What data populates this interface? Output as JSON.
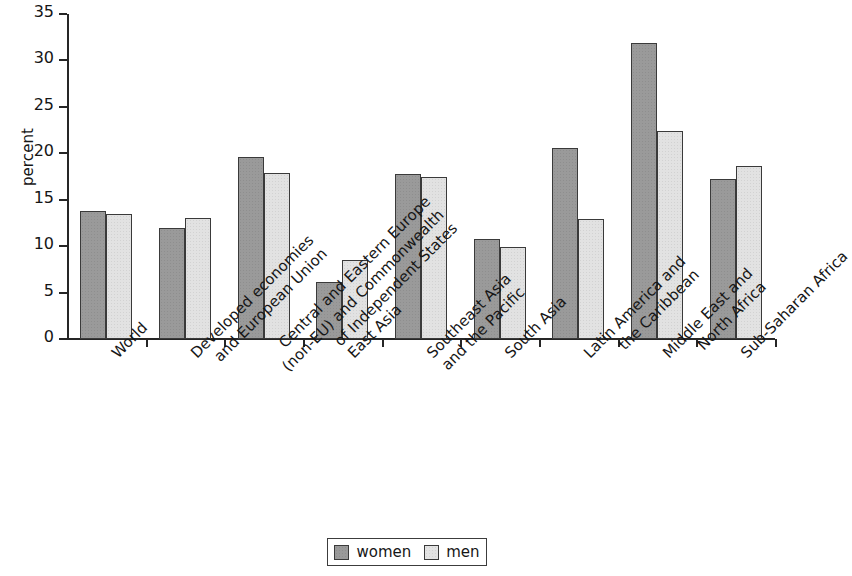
{
  "chart_data": {
    "type": "bar",
    "title": "",
    "subtitle": "",
    "xlabel": "",
    "ylabel": "percent",
    "ylim": [
      0,
      35
    ],
    "ytick_step": 5,
    "ytick_labels": [
      "0",
      "5",
      "10",
      "15",
      "20",
      "25",
      "30",
      "35"
    ],
    "grid": false,
    "legend_position": "bottom-center",
    "categories": [
      "World",
      "Developed economies and European Union",
      "Central and Eastern Europe (non-EU) and Commonwealth of Independent States",
      "East Asia",
      "Southeast Asia and the Pacific",
      "South Asia",
      "Latin America and the Caribbean",
      "Middle East and North Africa",
      "Sub-Saharan Africa"
    ],
    "category_lines": [
      [
        "World"
      ],
      [
        "Developed economies",
        "and European Union"
      ],
      [
        "Central and Eastern Europe",
        "(non-EU) and Commonwealth",
        "of Independent States"
      ],
      [
        "East Asia"
      ],
      [
        "Southeast Asia",
        "and the Pacific"
      ],
      [
        "South Asia"
      ],
      [
        "Latin America and",
        "the Caribbean"
      ],
      [
        "Middle East and",
        "North Africa"
      ],
      [
        "Sub-Saharan Africa"
      ]
    ],
    "series": [
      {
        "name": "women",
        "color": "#9a9a9a",
        "values": [
          13.8,
          12.0,
          19.6,
          6.1,
          17.8,
          10.8,
          20.6,
          31.9,
          17.2
        ]
      },
      {
        "name": "men",
        "color": "#e2e2e2",
        "values": [
          13.5,
          13.0,
          17.9,
          8.5,
          17.5,
          9.9,
          12.9,
          22.4,
          18.6
        ]
      }
    ]
  },
  "legend": {
    "items": [
      {
        "label": "women",
        "key": "legend-swatch-women"
      },
      {
        "label": "men",
        "key": "legend-swatch-men"
      }
    ]
  }
}
